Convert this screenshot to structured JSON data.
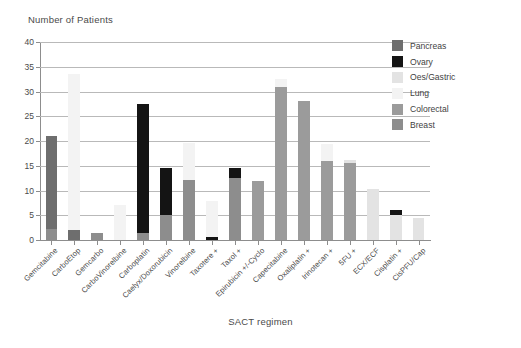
{
  "chart_data": {
    "type": "bar",
    "title": "",
    "ylabel": "Number of Patients",
    "xlabel": "SACT regimen",
    "ylim": [
      0,
      40
    ],
    "yticks": [
      0,
      5,
      10,
      15,
      20,
      25,
      30,
      35,
      40
    ],
    "grid": true,
    "stacked": true,
    "legend_position": "top-right",
    "categories": [
      "Gemcitabine",
      "CarboEtop",
      "Gemcarbo",
      "CarboVinorelbine",
      "Carboplatin",
      "Caelyx/Doxorubicin",
      "Vinorelbine",
      "Taxotere +",
      "Taxol +",
      "Epirubicin +/-Cyclo",
      "Capecitabine",
      "Oxaliplatin +",
      "Irinotecan +",
      "5FU +",
      "ECX/ECF",
      "Cisplatin +",
      "CisPFU/Cap"
    ],
    "series": [
      {
        "name": "Pancreas",
        "color": "#6e6e6e",
        "values": [
          18.8,
          2.0,
          0,
          0,
          0,
          0,
          0,
          0,
          0,
          0,
          0,
          0,
          0,
          0,
          0,
          0,
          0
        ]
      },
      {
        "name": "Ovary",
        "color": "#141414",
        "values": [
          0,
          0,
          0,
          0,
          26.0,
          9.5,
          0,
          0.7,
          2.0,
          0,
          0,
          0,
          0,
          0,
          0,
          1.0,
          0
        ]
      },
      {
        "name": "Oes/Gastric",
        "color": "#e3e3e3",
        "values": [
          0,
          0,
          0,
          0,
          0,
          0,
          0,
          0,
          0,
          0,
          0,
          0,
          0,
          0.7,
          10.3,
          5.0,
          4.5
        ]
      },
      {
        "name": "Lung",
        "color": "#f3f3f3",
        "values": [
          0,
          31.5,
          0,
          7.0,
          0,
          0,
          7.4,
          7.2,
          0,
          0,
          1.6,
          0,
          3.5,
          0,
          0,
          0,
          0
        ]
      },
      {
        "name": "Colorectal",
        "color": "#9b9b9b",
        "values": [
          0,
          0,
          0,
          0,
          0,
          0,
          0,
          0,
          0,
          12.0,
          31.0,
          28.0,
          16.0,
          15.5,
          0,
          0,
          0
        ]
      },
      {
        "name": "Breast",
        "color": "#8d8d8d",
        "values": [
          2.2,
          0,
          1.5,
          0,
          1.5,
          5.0,
          12.1,
          0,
          12.5,
          0,
          0,
          0,
          0,
          0,
          0,
          0,
          0
        ]
      }
    ],
    "stack_order_bottom_to_top": [
      "Breast",
      "Colorectal",
      "Oes/Gastric",
      "Pancreas",
      "Ovary",
      "Lung"
    ],
    "totals": [
      21.0,
      33.5,
      1.5,
      7.0,
      27.5,
      14.5,
      19.5,
      7.9,
      14.5,
      12.0,
      32.6,
      28.0,
      19.5,
      16.2,
      10.3,
      6.0,
      4.5
    ]
  },
  "legend": {
    "items": [
      {
        "label": "Pancreas",
        "color": "#6e6e6e"
      },
      {
        "label": "Ovary",
        "color": "#141414"
      },
      {
        "label": "Oes/Gastric",
        "color": "#e3e3e3"
      },
      {
        "label": "Lung",
        "color": "#f3f3f3"
      },
      {
        "label": "Colorectal",
        "color": "#9b9b9b"
      },
      {
        "label": "Breast",
        "color": "#8d8d8d"
      }
    ]
  }
}
